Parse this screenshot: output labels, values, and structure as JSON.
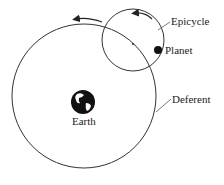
{
  "diagram": {
    "type": "epicycle-model",
    "labels": {
      "epicycle": "Epicycle",
      "planet": "Planet",
      "deferent": "Deferent",
      "earth": "Earth"
    },
    "colors": {
      "line": "#333333",
      "fill": "#111111",
      "background": "#ffffff"
    },
    "geometry": {
      "deferent": {
        "cx": 84,
        "cy": 96,
        "r": 72
      },
      "epicycle": {
        "cx": 133,
        "cy": 40,
        "r": 31
      },
      "planet": {
        "cx": 158,
        "cy": 50,
        "r": 4
      },
      "earth": {
        "cx": 83,
        "cy": 102,
        "r": 12
      }
    }
  }
}
